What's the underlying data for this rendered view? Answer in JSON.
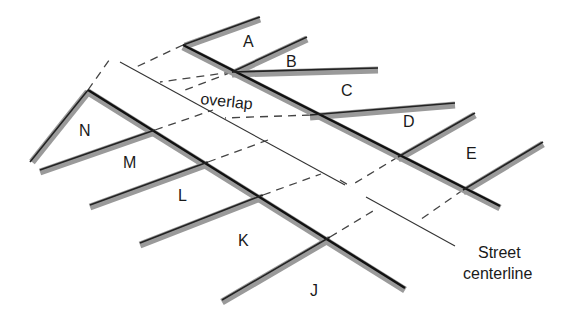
{
  "diagram": {
    "colors": {
      "background": "#ffffff",
      "boundary_casing": "#9a9a9a",
      "boundary_line": "#222222",
      "centerline": "#333333",
      "projection": "#444444",
      "text": "#1a1a1a"
    },
    "parcels": {
      "upper": [
        "A",
        "B",
        "C",
        "D",
        "E"
      ],
      "lower": [
        "N",
        "M",
        "L",
        "K",
        "J"
      ]
    },
    "labels": {
      "A": "A",
      "B": "B",
      "C": "C",
      "D": "D",
      "E": "E",
      "J": "J",
      "K": "K",
      "L": "L",
      "M": "M",
      "N": "N",
      "overlap": "overlap",
      "street_line1": "Street",
      "street_line2": "centerline"
    }
  }
}
